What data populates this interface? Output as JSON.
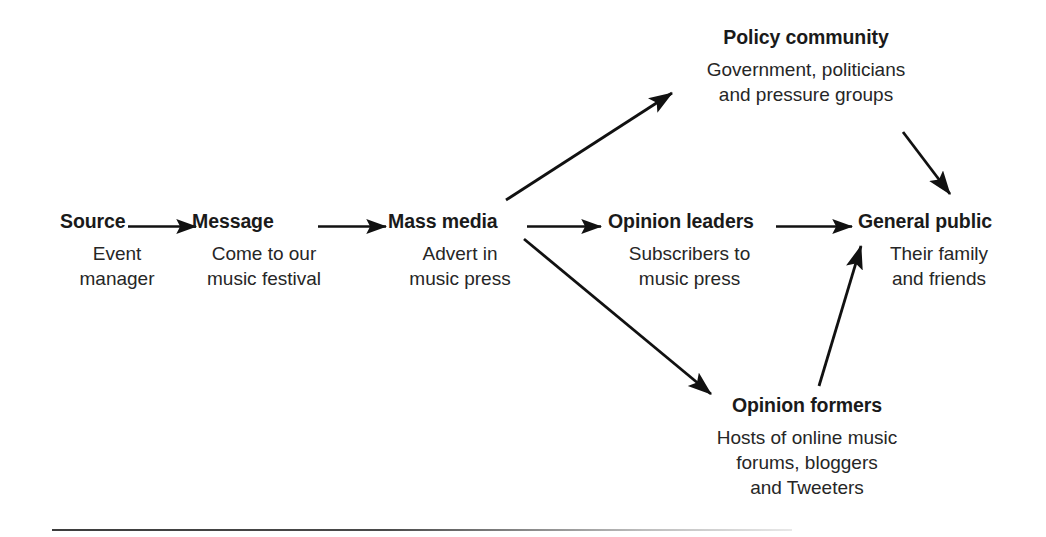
{
  "diagram": {
    "type": "flow-diagram",
    "title_visible": false,
    "background_color": "#ffffff",
    "text_color": "#1a1a1a",
    "arrow_color": "#111111",
    "nodes": [
      {
        "id": "source",
        "title": "Source",
        "description": "Event\nmanager"
      },
      {
        "id": "message",
        "title": "Message",
        "description": "Come to our\nmusic festival"
      },
      {
        "id": "mass_media",
        "title": "Mass media",
        "description": "Advert in\nmusic press"
      },
      {
        "id": "opinion_leaders",
        "title": "Opinion leaders",
        "description": "Subscribers to\nmusic press"
      },
      {
        "id": "general_public",
        "title": "General public",
        "description": "Their family\nand friends"
      },
      {
        "id": "policy_community",
        "title": "Policy community",
        "description": "Government, politicians\nand pressure groups"
      },
      {
        "id": "opinion_formers",
        "title": "Opinion formers",
        "description": "Hosts of online music\nforums, bloggers\nand Tweeters"
      }
    ],
    "edges": [
      {
        "from": "source",
        "to": "message",
        "style": "straight-horizontal"
      },
      {
        "from": "message",
        "to": "mass_media",
        "style": "straight-horizontal"
      },
      {
        "from": "mass_media",
        "to": "opinion_leaders",
        "style": "straight-horizontal"
      },
      {
        "from": "opinion_leaders",
        "to": "general_public",
        "style": "straight-horizontal"
      },
      {
        "from": "mass_media",
        "to": "policy_community",
        "style": "diagonal-up-right"
      },
      {
        "from": "mass_media",
        "to": "opinion_formers",
        "style": "diagonal-down-right"
      },
      {
        "from": "policy_community",
        "to": "general_public",
        "style": "diagonal-down-right"
      },
      {
        "from": "opinion_formers",
        "to": "general_public",
        "style": "diagonal-up-right"
      }
    ]
  }
}
